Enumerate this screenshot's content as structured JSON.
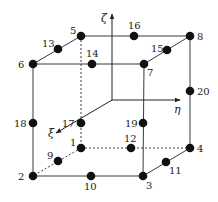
{
  "diagram": {
    "colors": {
      "line": "#3a3a3a",
      "node": "#111111",
      "background": "#ffffff"
    },
    "axes": [
      {
        "name": "zeta",
        "label": "ζ",
        "from": [
          112,
          100
        ],
        "to": [
          112,
          14
        ],
        "label_pos": [
          101,
          22
        ]
      },
      {
        "name": "eta",
        "label": "η",
        "from": [
          112,
          100
        ],
        "to": [
          180,
          100
        ],
        "label_pos": [
          174,
          113
        ]
      },
      {
        "name": "xi",
        "label": "ξ",
        "from": [
          112,
          100
        ],
        "to": [
          56,
          133
        ],
        "label_pos": [
          48,
          137
        ]
      }
    ],
    "nodes": [
      {
        "id": "1",
        "x": 81,
        "y": 148,
        "lx": 70,
        "ly": 146
      },
      {
        "id": "2",
        "x": 33,
        "y": 176,
        "lx": 18,
        "ly": 180
      },
      {
        "id": "3",
        "x": 143,
        "y": 176,
        "lx": 146,
        "ly": 189
      },
      {
        "id": "4",
        "x": 190,
        "y": 148,
        "lx": 197,
        "ly": 152
      },
      {
        "id": "5",
        "x": 81,
        "y": 36,
        "lx": 70,
        "ly": 34
      },
      {
        "id": "6",
        "x": 33,
        "y": 64,
        "lx": 18,
        "ly": 68
      },
      {
        "id": "7",
        "x": 144,
        "y": 64,
        "lx": 147,
        "ly": 76
      },
      {
        "id": "8",
        "x": 190,
        "y": 36,
        "lx": 197,
        "ly": 40
      },
      {
        "id": "9",
        "x": 58,
        "y": 161,
        "lx": 47,
        "ly": 159
      },
      {
        "id": "10",
        "x": 91,
        "y": 176,
        "lx": 84,
        "ly": 190
      },
      {
        "id": "11",
        "x": 166,
        "y": 162,
        "lx": 169,
        "ly": 174
      },
      {
        "id": "12",
        "x": 131,
        "y": 148,
        "lx": 124,
        "ly": 142
      },
      {
        "id": "13",
        "x": 58,
        "y": 49,
        "lx": 42,
        "ly": 47
      },
      {
        "id": "14",
        "x": 92,
        "y": 64,
        "lx": 86,
        "ly": 57
      },
      {
        "id": "15",
        "x": 167,
        "y": 50,
        "lx": 151,
        "ly": 52
      },
      {
        "id": "16",
        "x": 134,
        "y": 36,
        "lx": 128,
        "ly": 29
      },
      {
        "id": "17",
        "x": 81,
        "y": 123,
        "lx": 62,
        "ly": 127
      },
      {
        "id": "18",
        "x": 33,
        "y": 123,
        "lx": 14,
        "ly": 127
      },
      {
        "id": "19",
        "x": 143,
        "y": 123,
        "lx": 125,
        "ly": 127
      },
      {
        "id": "20",
        "x": 190,
        "y": 91,
        "lx": 197,
        "ly": 95
      }
    ],
    "edges_solid": [
      [
        "6",
        "7"
      ],
      [
        "5",
        "8"
      ],
      [
        "6",
        "5"
      ],
      [
        "7",
        "8"
      ],
      [
        "6",
        "2"
      ],
      [
        "7",
        "3"
      ],
      [
        "8",
        "4"
      ],
      [
        "2",
        "3"
      ],
      [
        "3",
        "4"
      ]
    ],
    "edges_dashed": [
      [
        "5",
        "1"
      ],
      [
        "1",
        "2"
      ],
      [
        "1",
        "4"
      ]
    ]
  }
}
